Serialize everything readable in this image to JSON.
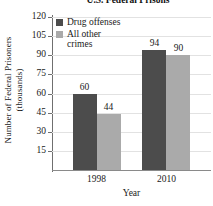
{
  "chart_data": {
    "type": "bar",
    "title": "U.S. Federal Prisons",
    "xlabel": "Year",
    "ylabel": "Number of Federal Prisoners\n(thousands)",
    "ylabel_line1": "Number of Federal Prisoners",
    "ylabel_line2": "(thousands)",
    "categories": [
      "1998",
      "2010"
    ],
    "series": [
      {
        "name": "Drug offenses",
        "name_display": "Drug offenses",
        "color": "#4c4c4c",
        "values": [
          60,
          44
        ]
      },
      {
        "name": "All other crimes",
        "name_display": "All other\ncrimes",
        "color": "#aaaaaa",
        "values": [
          44,
          90
        ]
      }
    ],
    "series_fixed": [
      {
        "name": "Drug offenses",
        "name_display": "Drug offenses",
        "color": "#4c4c4c",
        "values": [
          60,
          94
        ]
      },
      {
        "name": "All other crimes",
        "name_display": "All other\ncrimes",
        "color": "#aaaaaa",
        "values": [
          44,
          90
        ]
      }
    ],
    "data_labels": {
      "1998": {
        "Drug offenses": "60",
        "All other crimes": "44"
      },
      "2010": {
        "Drug offenses": "94",
        "All other crimes": "90"
      }
    },
    "ylim": [
      0,
      120
    ],
    "ytick_labels": [
      "15",
      "30",
      "45",
      "60",
      "75",
      "90",
      "105",
      "120"
    ],
    "ytick_values": [
      15,
      30,
      45,
      60,
      75,
      90,
      105,
      120
    ],
    "grid": true,
    "legend_position": "upper-left-inside"
  },
  "legend": {
    "entries": [
      {
        "label": "Drug offenses",
        "color": "#4c4c4c"
      },
      {
        "label": "All other\ncrimes",
        "color": "#aaaaaa"
      }
    ]
  },
  "colors": {
    "drug_offenses": "#4c4c4c",
    "all_other_crimes": "#aaaaaa",
    "axis": "#6f6f6f",
    "grid": "#e2e2e2",
    "text": "#1a1a1a",
    "background": "#ffffff"
  }
}
